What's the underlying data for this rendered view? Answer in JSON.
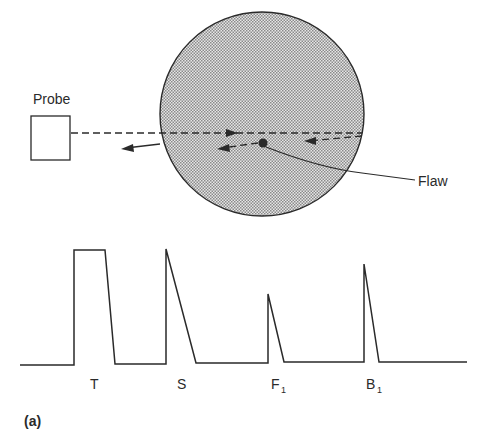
{
  "diagram": {
    "probe_label": "Probe",
    "flaw_label": "Flaw",
    "panel_label": "(a)",
    "colors": {
      "ink": "#2a2a2a",
      "specimen_fill": "#bdbdbd",
      "background": "#ffffff"
    },
    "waveform": {
      "peaks": [
        {
          "label": "T",
          "subscript": ""
        },
        {
          "label": "S",
          "subscript": ""
        },
        {
          "label": "F",
          "subscript": "1"
        },
        {
          "label": "B",
          "subscript": "1"
        }
      ]
    }
  }
}
